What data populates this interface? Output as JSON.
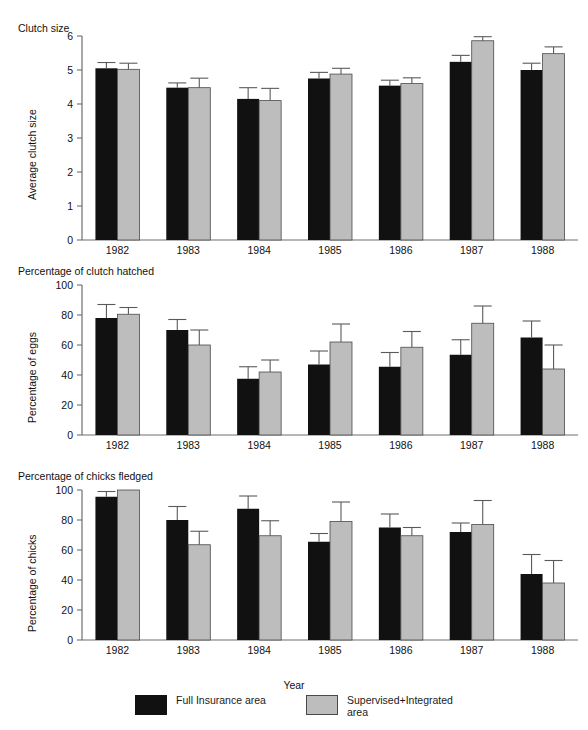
{
  "figure": {
    "xlabel": "Year",
    "categories": [
      "1982",
      "1983",
      "1984",
      "1985",
      "1986",
      "1987",
      "1988"
    ],
    "legend": [
      {
        "key": "full_insurance",
        "label": "Full Insurance area",
        "color": "#111111"
      },
      {
        "key": "supervised_integrated",
        "label": "Supervised+Integrated\narea",
        "color": "#bdbdbd"
      }
    ]
  },
  "chart_data": [
    {
      "type": "bar",
      "title": "Clutch size",
      "xlabel": "Year",
      "ylabel": "Average clutch size",
      "categories": [
        "1982",
        "1983",
        "1984",
        "1985",
        "1986",
        "1987",
        "1988"
      ],
      "ylim": [
        0,
        6
      ],
      "yticks": [
        0,
        1,
        2,
        3,
        4,
        5,
        6
      ],
      "grid": false,
      "legend_position": "bottom",
      "series": [
        {
          "name": "Full Insurance area",
          "color": "#111111",
          "values": [
            5.05,
            4.48,
            4.15,
            4.75,
            4.54,
            5.24,
            5.0
          ],
          "err_upper": [
            5.22,
            4.62,
            4.48,
            4.93,
            4.7,
            5.43,
            5.2
          ]
        },
        {
          "name": "Supervised+Integrated area",
          "color": "#bdbdbd",
          "values": [
            5.02,
            4.48,
            4.1,
            4.88,
            4.6,
            5.86,
            5.48
          ],
          "err_upper": [
            5.2,
            4.76,
            4.46,
            5.05,
            4.77,
            5.98,
            5.68
          ]
        }
      ]
    },
    {
      "type": "bar",
      "title": "Percentage of clutch hatched",
      "xlabel": "Year",
      "ylabel": "Percentage of eggs",
      "categories": [
        "1982",
        "1983",
        "1984",
        "1985",
        "1986",
        "1987",
        "1988"
      ],
      "ylim": [
        0,
        100
      ],
      "yticks": [
        0,
        20,
        40,
        60,
        80,
        100
      ],
      "grid": false,
      "legend_position": "bottom",
      "series": [
        {
          "name": "Full Insurance area",
          "color": "#111111",
          "values": [
            78,
            70,
            37.5,
            47,
            45.5,
            53.5,
            65
          ],
          "err_upper": [
            87,
            77,
            45.5,
            56,
            55,
            63.5,
            76
          ]
        },
        {
          "name": "Supervised+Integrated area",
          "color": "#bdbdbd",
          "values": [
            80.5,
            60,
            42,
            62,
            58.5,
            74.5,
            44
          ],
          "err_upper": [
            85,
            70,
            50,
            74,
            69,
            86,
            60
          ]
        }
      ]
    },
    {
      "type": "bar",
      "title": "Percentage of chicks fledged",
      "xlabel": "Year",
      "ylabel": "Percentage of chicks",
      "categories": [
        "1982",
        "1983",
        "1984",
        "1985",
        "1986",
        "1987",
        "1988"
      ],
      "ylim": [
        0,
        100
      ],
      "yticks": [
        0,
        20,
        40,
        60,
        80,
        100
      ],
      "grid": false,
      "legend_position": "bottom",
      "series": [
        {
          "name": "Full Insurance area",
          "color": "#111111",
          "values": [
            95.5,
            80,
            87.5,
            65.5,
            75,
            72,
            44
          ],
          "err_upper": [
            99,
            89,
            96,
            71,
            84,
            78,
            57
          ]
        },
        {
          "name": "Supervised+Integrated area",
          "color": "#bdbdbd",
          "values": [
            100,
            63.5,
            69.5,
            79,
            69.5,
            77,
            38
          ],
          "err_upper": [
            100,
            72.5,
            79.5,
            92,
            75,
            93,
            53
          ]
        }
      ]
    }
  ]
}
